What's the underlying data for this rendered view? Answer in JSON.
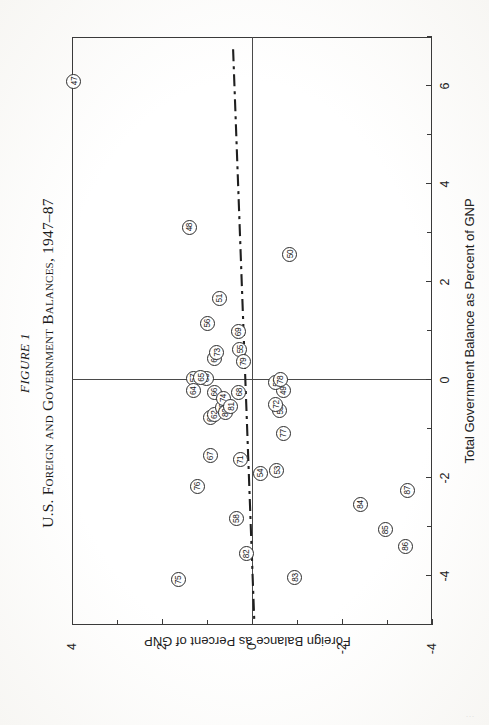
{
  "figure": {
    "number_label": "FIGURE 1",
    "title": "U.S. Foreign and Government Balances, 1947–87",
    "page_artifact": "..."
  },
  "chart_data": {
    "type": "scatter",
    "title": "U.S. Foreign and Government Balances, 1947–87",
    "subtitle": "FIGURE 1",
    "xlabel": "Total Government Balance as Percent of GNP",
    "ylabel": "Foreign Balance as Percent of GNP",
    "xlim": [
      -5,
      7
    ],
    "ylim": [
      -4,
      4
    ],
    "xticks": [
      -4,
      -2,
      0,
      2,
      4,
      6
    ],
    "xtick_labels": [
      "-4",
      "-2",
      "0",
      "2",
      "4",
      "6"
    ],
    "xminorticks": [
      -5,
      -3,
      -1,
      1,
      3,
      5,
      7
    ],
    "yticks": [
      -4,
      -2,
      0,
      2,
      4
    ],
    "ytick_labels": [
      "-4",
      "-2",
      "0",
      "2",
      "4"
    ],
    "yminorticks": [
      -3,
      -1,
      1,
      3
    ],
    "grid": false,
    "legend": null,
    "point_label_field": "year",
    "annotations": [
      {
        "name": "regression-line",
        "style": "dash-dot",
        "x1": 6.75,
        "y1": 0.42,
        "x2": -4.9,
        "y2": -0.05
      }
    ],
    "points": [
      {
        "year": "47",
        "x": 6.1,
        "y": 3.96
      },
      {
        "year": "48",
        "x": 3.12,
        "y": 1.39
      },
      {
        "year": "49",
        "x": -0.22,
        "y": -0.7
      },
      {
        "year": "50",
        "x": 2.57,
        "y": -0.84
      },
      {
        "year": "51",
        "x": 1.67,
        "y": 0.72
      },
      {
        "year": "52",
        "x": -0.05,
        "y": -0.53
      },
      {
        "year": "53",
        "x": -1.84,
        "y": -0.55
      },
      {
        "year": "54",
        "x": -1.9,
        "y": -0.18
      },
      {
        "year": "55",
        "x": 0.63,
        "y": 0.27
      },
      {
        "year": "56",
        "x": 1.16,
        "y": 0.99
      },
      {
        "year": "57",
        "x": 0.04,
        "y": 1.31
      },
      {
        "year": "58",
        "x": -2.83,
        "y": 0.35
      },
      {
        "year": "59",
        "x": -0.62,
        "y": -0.62
      },
      {
        "year": "60",
        "x": 0.44,
        "y": 0.83
      },
      {
        "year": "61",
        "x": -0.77,
        "y": 0.93
      },
      {
        "year": "62",
        "x": -0.71,
        "y": 0.83
      },
      {
        "year": "63",
        "x": 0.04,
        "y": 1.02
      },
      {
        "year": "64",
        "x": -0.22,
        "y": 1.31
      },
      {
        "year": "65",
        "x": 0.05,
        "y": 1.14
      },
      {
        "year": "66",
        "x": -0.25,
        "y": 0.83
      },
      {
        "year": "67",
        "x": -1.55,
        "y": 0.93
      },
      {
        "year": "68",
        "x": -0.25,
        "y": 0.29
      },
      {
        "year": "69",
        "x": 0.98,
        "y": 0.3
      },
      {
        "year": "70",
        "x": -0.56,
        "y": 0.66
      },
      {
        "year": "71",
        "x": -1.63,
        "y": 0.26
      },
      {
        "year": "72",
        "x": -0.5,
        "y": -0.53
      },
      {
        "year": "73",
        "x": 0.56,
        "y": 0.78
      },
      {
        "year": "74",
        "x": -0.37,
        "y": 0.63
      },
      {
        "year": "75",
        "x": -4.08,
        "y": 1.63
      },
      {
        "year": "76",
        "x": -2.17,
        "y": 1.21
      },
      {
        "year": "77",
        "x": -1.09,
        "y": -0.69
      },
      {
        "year": "78",
        "x": 0.0,
        "y": -0.63
      },
      {
        "year": "79",
        "x": 0.37,
        "y": 0.2
      },
      {
        "year": "80",
        "x": -0.67,
        "y": 0.6
      },
      {
        "year": "81",
        "x": -0.54,
        "y": 0.47
      },
      {
        "year": "82",
        "x": -3.55,
        "y": 0.12
      },
      {
        "year": "83",
        "x": -4.03,
        "y": -0.95
      },
      {
        "year": "84",
        "x": -2.54,
        "y": -2.4
      },
      {
        "year": "85",
        "x": -3.06,
        "y": -2.97
      },
      {
        "year": "86",
        "x": -3.4,
        "y": -3.4
      },
      {
        "year": "87",
        "x": -2.25,
        "y": -3.45
      }
    ]
  }
}
